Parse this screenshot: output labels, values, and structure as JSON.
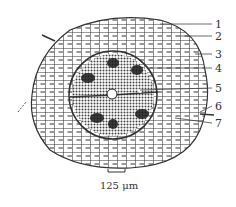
{
  "figure": {
    "type": "root cross-section diagram",
    "labels": [
      {
        "id": "1",
        "y": 24
      },
      {
        "id": "2",
        "y": 36
      },
      {
        "id": "3",
        "y": 54
      },
      {
        "id": "4",
        "y": 68
      },
      {
        "id": "5",
        "y": 88
      },
      {
        "id": "6",
        "y": 106
      },
      {
        "id": "7",
        "y": 123
      }
    ],
    "scale_bar": {
      "label": "125 μm"
    },
    "colors": {
      "line": "#222222",
      "background": "#ffffff",
      "stele": "#555555",
      "patch": "#1a1a1a"
    }
  }
}
